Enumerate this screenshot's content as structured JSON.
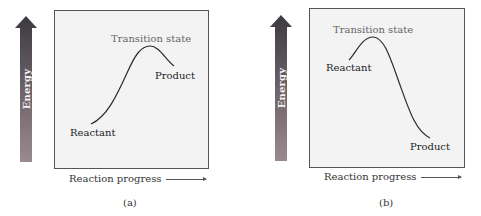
{
  "colors": {
    "arrow_top": "#3e3a42",
    "arrow_bottom": "#9a8a8e",
    "plot_background": "#f3f3f3",
    "plot_border": "#555555",
    "curve": "#2a2a2a"
  },
  "panels": [
    {
      "id": "a",
      "caption": "(a)",
      "energy_axis_label": "Energy",
      "x_axis_label": "Reaction progress",
      "labels": {
        "transition_state": "Transition state",
        "reactant": "Reactant",
        "product": "Product"
      },
      "profile": "endothermic"
    },
    {
      "id": "b",
      "caption": "(b)",
      "energy_axis_label": "Energy",
      "x_axis_label": "Reaction progress",
      "labels": {
        "transition_state": "Transition state",
        "reactant": "Reactant",
        "product": "Product"
      },
      "profile": "exothermic"
    }
  ]
}
